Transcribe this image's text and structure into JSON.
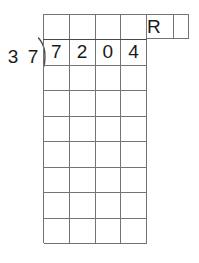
{
  "worksheet": {
    "type": "long-division",
    "divisor": {
      "value": "37",
      "digits": [
        "3",
        "7"
      ]
    },
    "dividend": {
      "value": "7204",
      "digits": [
        "7",
        "2",
        "0",
        "4"
      ]
    },
    "quotient": {
      "digits": [
        "",
        "",
        "",
        ""
      ]
    },
    "remainder": {
      "label": "R",
      "value": ""
    },
    "grid": {
      "columns": 4,
      "rows": 9,
      "dividend_row_index": 1,
      "quotient_row_index": 0,
      "extension_cells": 2,
      "work_rows": 7,
      "line_color": "#737373",
      "vinculum_color": "#4a4a4a",
      "text_color": "#1a1a1a",
      "background_color": "#ffffff"
    },
    "work_rows": [
      [
        "",
        "",
        "",
        ""
      ],
      [
        "",
        "",
        "",
        ""
      ],
      [
        "",
        "",
        "",
        ""
      ],
      [
        "",
        "",
        "",
        ""
      ],
      [
        "",
        "",
        "",
        ""
      ],
      [
        "",
        "",
        "",
        ""
      ],
      [
        "",
        "",
        "",
        ""
      ]
    ]
  }
}
